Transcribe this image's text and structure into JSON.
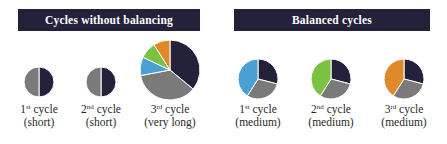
{
  "panels": {
    "left": {
      "title": "Cycles without balancing",
      "cycles": [
        {
          "ordinal": "1",
          "suffix": "st",
          "word": "cycle",
          "duration": "(short)"
        },
        {
          "ordinal": "2",
          "suffix": "nd",
          "word": "cycle",
          "duration": "(short)"
        },
        {
          "ordinal": "3",
          "suffix": "rd",
          "word": "cycle",
          "duration": "(very long)"
        }
      ]
    },
    "right": {
      "title": "Balanced cycles",
      "cycles": [
        {
          "ordinal": "1",
          "suffix": "st",
          "word": "cycle",
          "duration": "(medium)"
        },
        {
          "ordinal": "2",
          "suffix": "nd",
          "word": "cycle",
          "duration": "(medium)"
        },
        {
          "ordinal": "3",
          "suffix": "rd",
          "word": "cycle",
          "duration": "(medium)"
        }
      ]
    }
  },
  "colors": {
    "header_bg": "#24223a",
    "navy": "#24223a",
    "gray": "#7a7a7a",
    "blue": "#4aa0d5",
    "green": "#7cc242",
    "orange": "#e0892a",
    "separator": "#ffffff"
  },
  "chart_data": [
    {
      "type": "pie",
      "title": "1st cycle (short)",
      "segments": [
        {
          "color": "navy",
          "value": 50
        },
        {
          "color": "gray",
          "value": 50
        }
      ]
    },
    {
      "type": "pie",
      "title": "2nd cycle (short)",
      "segments": [
        {
          "color": "navy",
          "value": 50
        },
        {
          "color": "gray",
          "value": 50
        }
      ]
    },
    {
      "type": "pie",
      "title": "3rd cycle (very long)",
      "segments": [
        {
          "color": "navy",
          "value": 36
        },
        {
          "color": "gray",
          "value": 36
        },
        {
          "color": "blue",
          "value": 10
        },
        {
          "color": "green",
          "value": 9
        },
        {
          "color": "orange",
          "value": 9
        }
      ]
    },
    {
      "type": "pie",
      "title": "1st cycle (medium)",
      "segments": [
        {
          "color": "navy",
          "value": 29
        },
        {
          "color": "gray",
          "value": 30
        },
        {
          "color": "blue",
          "value": 41
        }
      ]
    },
    {
      "type": "pie",
      "title": "2nd cycle (medium)",
      "segments": [
        {
          "color": "navy",
          "value": 29
        },
        {
          "color": "gray",
          "value": 30
        },
        {
          "color": "green",
          "value": 41
        }
      ]
    },
    {
      "type": "pie",
      "title": "3rd cycle (medium)",
      "segments": [
        {
          "color": "navy",
          "value": 29
        },
        {
          "color": "gray",
          "value": 30
        },
        {
          "color": "orange",
          "value": 41
        }
      ]
    }
  ]
}
